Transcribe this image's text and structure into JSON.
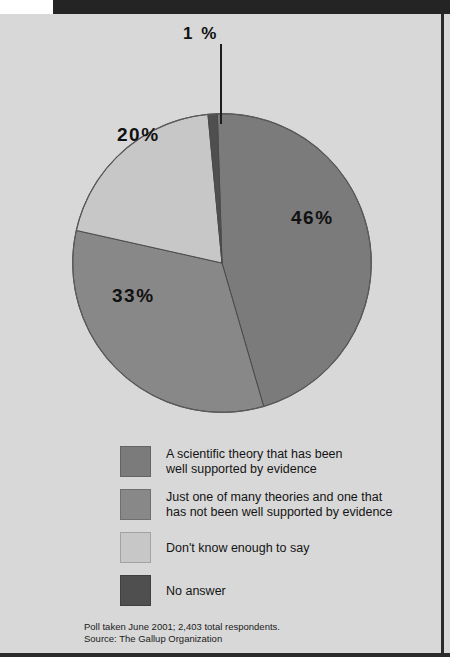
{
  "panel": {
    "background_color": "#d8d8d8",
    "accent_bar_color": "#242424",
    "rule_color": "#2b2b2b"
  },
  "chart_data": {
    "type": "pie",
    "title": "",
    "subtitle": "",
    "categories": [
      "A scientific theory that has been well supported by evidence",
      "Just one of many theories and one that has not been well supported by evidence",
      "Don't know enough to say",
      "No answer"
    ],
    "values": [
      46,
      33,
      20,
      1
    ],
    "value_labels": [
      "46%",
      "33%",
      "20%",
      "1 %"
    ],
    "colors": [
      "#7b7b7b",
      "#888888",
      "#c7c7c7",
      "#4f4f4f"
    ],
    "legend_position": "bottom",
    "grid": false,
    "units": "percent",
    "total_respondents": "2,403",
    "start_angle_deg": -1.8,
    "slices": [
      {
        "label": "A scientific theory that has been well supported by evidence",
        "value": 46,
        "display": "46%",
        "color": "#7b7b7b"
      },
      {
        "label": "Just one of many theories and one that has not been well supported by evidence",
        "value": 33,
        "display": "33%",
        "color": "#888888"
      },
      {
        "label": "Don't know enough to say",
        "value": 20,
        "display": "20%",
        "color": "#c7c7c7"
      },
      {
        "label": "No answer",
        "value": 1,
        "display": "1 %",
        "color": "#4f4f4f"
      }
    ]
  },
  "labels": {
    "pct_one": "1 %",
    "pct_twenty": "20%",
    "pct_fortysix": "46%",
    "pct_thirtythree": "33%"
  },
  "legend": {
    "items": [
      {
        "color": "#7b7b7b",
        "line1": "A scientific theory that has been",
        "line2": "well supported by evidence"
      },
      {
        "color": "#888888",
        "line1": "Just one of many theories and one that",
        "line2": "has not been well supported by evidence"
      },
      {
        "color": "#c7c7c7",
        "line1": "Don't know enough to say",
        "line2": ""
      },
      {
        "color": "#4f4f4f",
        "line1": "No answer",
        "line2": ""
      }
    ]
  },
  "source": {
    "line1": "Poll taken June 2001; 2,403 total respondents.",
    "line2": "Source: The Gallup Organization"
  }
}
